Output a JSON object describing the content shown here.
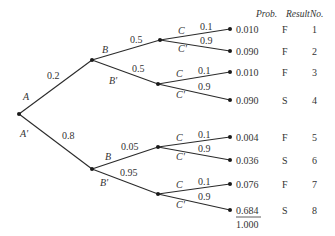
{
  "diagram": {
    "type": "probability-tree",
    "headers": {
      "prob": "Prob.",
      "result": "Result",
      "no": "No."
    },
    "root": {
      "label": "A",
      "x": 19,
      "y": 114
    },
    "level1": [
      {
        "event": "A",
        "prob": "0.2",
        "node": {
          "x": 92,
          "y": 60
        },
        "event_pos": {
          "x": 23,
          "y": 100
        },
        "prob_pos": {
          "x": 47,
          "y": 79
        }
      },
      {
        "event": "A'",
        "prob": "0.8",
        "node": {
          "x": 92,
          "y": 169
        },
        "event_pos": {
          "x": 20,
          "y": 137
        },
        "prob_pos": {
          "x": 62,
          "y": 139
        }
      }
    ],
    "level2": [
      {
        "parent": 0,
        "event": "B",
        "prob": "0.5",
        "node": {
          "x": 160,
          "y": 40
        },
        "event_pos": {
          "x": 102,
          "y": 53
        },
        "prob_pos": {
          "x": 130,
          "y": 43
        }
      },
      {
        "parent": 0,
        "event": "B'",
        "prob": "0.5",
        "node": {
          "x": 158,
          "y": 84
        },
        "event_pos": {
          "x": 109,
          "y": 84
        },
        "prob_pos": {
          "x": 132,
          "y": 72
        }
      },
      {
        "parent": 1,
        "event": "B",
        "prob": "0.05",
        "node": {
          "x": 158,
          "y": 147
        },
        "event_pos": {
          "x": 105,
          "y": 160
        },
        "prob_pos": {
          "x": 121,
          "y": 150
        }
      },
      {
        "parent": 1,
        "event": "B'",
        "prob": "0.95",
        "node": {
          "x": 158,
          "y": 194
        },
        "event_pos": {
          "x": 100,
          "y": 186
        },
        "prob_pos": {
          "x": 120,
          "y": 176
        }
      }
    ],
    "outcomes": [
      {
        "parent": 0,
        "event": "C",
        "prob": "0.1",
        "y": 29,
        "joint": "0.010",
        "result": "F",
        "no": "1"
      },
      {
        "parent": 0,
        "event": "C'",
        "prob": "0.9",
        "y": 51,
        "joint": "0.090",
        "result": "F",
        "no": "2"
      },
      {
        "parent": 1,
        "event": "C",
        "prob": "0.1",
        "y": 72,
        "joint": "0.010",
        "result": "F",
        "no": "3"
      },
      {
        "parent": 1,
        "event": "C'",
        "prob": "0.9",
        "y": 100,
        "joint": "0.090",
        "result": "S",
        "no": "4"
      },
      {
        "parent": 2,
        "event": "C",
        "prob": "0.1",
        "y": 137,
        "joint": "0.004",
        "result": "F",
        "no": "5"
      },
      {
        "parent": 2,
        "event": "C'",
        "prob": "0.9",
        "y": 160,
        "joint": "0.036",
        "result": "S",
        "no": "6"
      },
      {
        "parent": 3,
        "event": "C",
        "prob": "0.1",
        "y": 184,
        "joint": "0.076",
        "result": "F",
        "no": "7"
      },
      {
        "parent": 3,
        "event": "C'",
        "prob": "0.9",
        "y": 210,
        "joint": "0.684",
        "result": "S",
        "no": "8"
      }
    ],
    "total": "1.000",
    "leaf_x": 230
  }
}
